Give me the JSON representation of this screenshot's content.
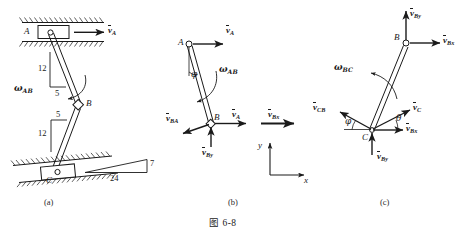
{
  "figure": {
    "caption": "图 6-8",
    "panels": [
      {
        "id": "a",
        "label": "(a)"
      },
      {
        "id": "b",
        "label": "(b)"
      },
      {
        "id": "c",
        "label": "(c)"
      }
    ]
  },
  "panel_a": {
    "points": {
      "A": "A",
      "B": "B",
      "C": "C"
    },
    "velocity_A": {
      "symbol": "v",
      "sub": "A"
    },
    "omega_AB": {
      "symbol": "ω",
      "sub": "AB"
    },
    "slope_AB": {
      "rise": "12",
      "run": "5"
    },
    "slope_BC": {
      "rise": "12",
      "run": "5"
    },
    "incline": {
      "rise": "7",
      "run": "24"
    }
  },
  "panel_b": {
    "points": {
      "A": "A",
      "B": "B"
    },
    "angle_phi": "φ",
    "omega_AB": {
      "symbol": "ω",
      "sub": "AB"
    },
    "vectors": [
      {
        "name": "v_A_at_A",
        "symbol": "v",
        "sub": "A"
      },
      {
        "name": "v_A_at_B",
        "symbol": "v",
        "sub": "A"
      },
      {
        "name": "v_BA",
        "symbol": "v",
        "sub": "BA"
      },
      {
        "name": "v_By",
        "symbol": "v",
        "sub": "By"
      },
      {
        "name": "v_Bx_transfer",
        "symbol": "v",
        "sub": "Bx"
      }
    ],
    "axes": {
      "x": "x",
      "y": "y"
    }
  },
  "panel_c": {
    "points": {
      "B": "B",
      "C": "C"
    },
    "omega_BC": {
      "symbol": "ω",
      "sub": "BC"
    },
    "angle_phi": "φ",
    "angle_theta": "θ",
    "vectors": [
      {
        "name": "v_By_at_B",
        "symbol": "v",
        "sub": "By"
      },
      {
        "name": "v_Bx_at_B",
        "symbol": "v",
        "sub": "Bx"
      },
      {
        "name": "v_CB",
        "symbol": "v",
        "sub": "CB"
      },
      {
        "name": "v_C",
        "symbol": "v",
        "sub": "C"
      },
      {
        "name": "v_Bx_at_C",
        "symbol": "v",
        "sub": "Bx"
      },
      {
        "name": "v_By_at_C",
        "symbol": "v",
        "sub": "By"
      }
    ]
  },
  "colors": {
    "ink": "#1a1a1a",
    "background": "#ffffff"
  }
}
